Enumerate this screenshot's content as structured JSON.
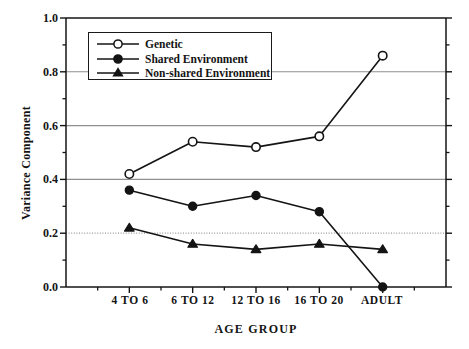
{
  "chart_data": {
    "type": "line",
    "title": "",
    "xlabel": "AGE GROUP",
    "ylabel": "Variance Component",
    "categories": [
      "4 TO 6",
      "6 TO 12",
      "12 TO 16",
      "16 TO 20",
      "ADULT"
    ],
    "ylim": [
      0.0,
      1.0
    ],
    "xlim": [
      0,
      6
    ],
    "ytick_labels": [
      "0.0",
      "0.2",
      "0.4",
      "0.6",
      "0.8",
      "1.0"
    ],
    "ytick_values": [
      0.0,
      0.2,
      0.4,
      0.6,
      0.8,
      1.0
    ],
    "yminor_values": [
      0.1,
      0.3,
      0.5,
      0.7,
      0.9
    ],
    "grid": {
      "horizontal": true,
      "vertical": false,
      "lines": [
        {
          "value": 0.2,
          "style": "dotted",
          "color": "#9a9a9a"
        },
        {
          "value": 0.4,
          "style": "solid",
          "color": "#8f8f8f"
        },
        {
          "value": 0.6,
          "style": "solid",
          "color": "#8f8f8f"
        },
        {
          "value": 0.8,
          "style": "solid",
          "color": "#8f8f8f"
        }
      ]
    },
    "legend_position": "upper left",
    "series": [
      {
        "name": "Genetic",
        "marker": "open-circle",
        "color": "#141414",
        "values": [
          0.42,
          0.54,
          0.52,
          0.56,
          0.86
        ]
      },
      {
        "name": "Shared Environment",
        "marker": "filled-circle",
        "color": "#141414",
        "values": [
          0.36,
          0.3,
          0.34,
          0.28,
          0.0
        ]
      },
      {
        "name": "Non-shared Environment",
        "marker": "filled-triangle",
        "color": "#141414",
        "values": [
          0.22,
          0.16,
          0.14,
          0.16,
          0.14
        ]
      }
    ]
  },
  "axes": {
    "ylabel": "Variance Component",
    "xlabel": "AGE GROUP",
    "ytick_0": "0.0",
    "ytick_1": "0.2",
    "ytick_2": "0.4",
    "ytick_3": "0.6",
    "ytick_4": "0.8",
    "ytick_5": "1.0",
    "xtick_0": "4 TO 6",
    "xtick_1": "6 TO 12",
    "xtick_2": "12 TO 16",
    "xtick_3": "16 TO 20",
    "xtick_4": "ADULT"
  },
  "legend": {
    "entries": [
      {
        "label": "Genetic",
        "marker": "open-circle"
      },
      {
        "label": "Shared Environment",
        "marker": "filled-circle"
      },
      {
        "label": "Non-shared Environment",
        "marker": "filled-triangle"
      }
    ]
  },
  "colors": {
    "ink": "#141414",
    "grid_solid": "#8f8f8f",
    "grid_dotted": "#9a9a9a",
    "background": "#ffffff"
  }
}
